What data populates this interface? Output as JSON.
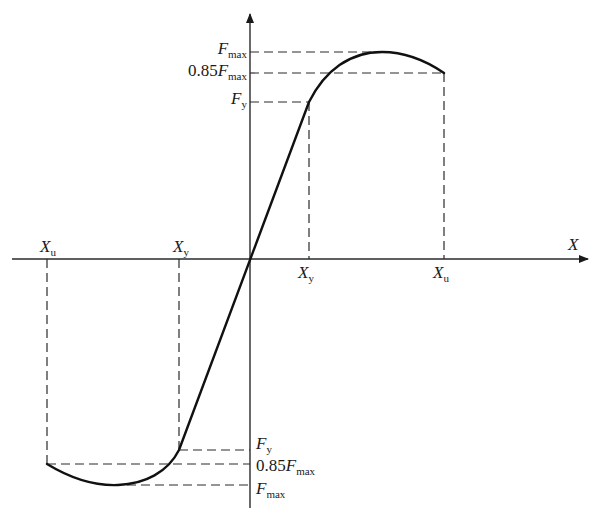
{
  "diagram": {
    "type": "force-displacement skeleton curve (antisymmetric)",
    "x_axis": {
      "label": "X"
    },
    "positive_side": {
      "x_ticks": [
        {
          "main": "X",
          "sub": "y"
        },
        {
          "main": "X",
          "sub": "u"
        }
      ],
      "y_ticks": [
        {
          "prefix": "",
          "main": "F",
          "sub": "max"
        },
        {
          "prefix": "0.85",
          "main": "F",
          "sub": "max"
        },
        {
          "prefix": "",
          "main": "F",
          "sub": "y"
        }
      ]
    },
    "negative_side": {
      "x_ticks": [
        {
          "main": "X",
          "sub": "u"
        },
        {
          "main": "X",
          "sub": "y"
        }
      ],
      "y_ticks": [
        {
          "prefix": "",
          "main": "F",
          "sub": "y"
        },
        {
          "prefix": "0.85",
          "main": "F",
          "sub": "max"
        },
        {
          "prefix": "",
          "main": "F",
          "sub": "max"
        }
      ]
    },
    "key_points_normalized": {
      "note": "displacement as fraction of Xu, force as fraction of Fmax",
      "yield": {
        "x": 0.3,
        "f": 0.78
      },
      "peak": {
        "x": 0.66,
        "f": 1.0
      },
      "ultimate": {
        "x": 1.0,
        "f": 0.85
      }
    },
    "colors": {
      "line": "#111111",
      "background": "#ffffff"
    }
  }
}
